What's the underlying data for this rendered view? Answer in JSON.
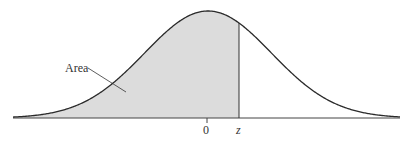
{
  "chart_data": {
    "type": "area",
    "title": "",
    "xlabel": "",
    "ylabel": "",
    "tick_labels": [
      "0",
      "z"
    ],
    "annotations": [
      {
        "text": "Area",
        "points_to": "shaded region left of z"
      }
    ],
    "curve": {
      "distribution": "normal",
      "mean": 0,
      "sd": 1
    },
    "shaded_region": {
      "from": "-inf",
      "to": "z"
    },
    "z_approx": 0.5,
    "grid": false,
    "legend": null
  },
  "labels": {
    "area": "Area",
    "zero": "0",
    "z": "z"
  },
  "colors": {
    "curve": "#2a2a2a",
    "fill": "#dcdcdc",
    "axis": "#444444"
  }
}
